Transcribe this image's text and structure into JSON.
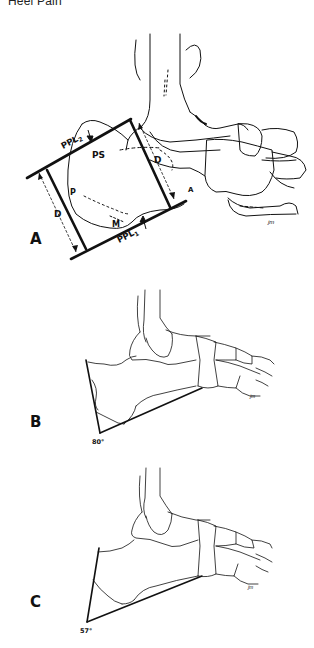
{
  "header": {
    "title": "Heel Pain"
  },
  "figures": [
    {
      "id": "A",
      "label": "A",
      "annotations": {
        "ppl2": "PPL",
        "ppl2_sub": "2",
        "ppl1": "PPL",
        "ppl1_sub": "1",
        "ps": "PS",
        "p": "P",
        "m": "M",
        "a": "A",
        "d_left": "D",
        "d_right": "D",
        "signature": "jm"
      }
    },
    {
      "id": "B",
      "label": "B",
      "angle": "80°",
      "signature": "jm"
    },
    {
      "id": "C",
      "label": "C",
      "angle": "57°",
      "signature": "jm"
    }
  ]
}
